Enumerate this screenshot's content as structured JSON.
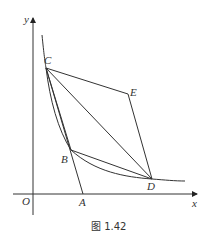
{
  "figure": {
    "caption": "图 1.42",
    "axes": {
      "x_label": "x",
      "y_label": "y",
      "origin_label": "O"
    },
    "points": [
      {
        "name": "C",
        "label": "C",
        "x": 46,
        "y": 68
      },
      {
        "name": "E",
        "label": "E",
        "x": 128,
        "y": 94
      },
      {
        "name": "B",
        "label": "B",
        "x": 71,
        "y": 150
      },
      {
        "name": "D",
        "label": "D",
        "x": 152,
        "y": 179
      },
      {
        "name": "A",
        "label": "A",
        "x": 83,
        "y": 194
      }
    ],
    "segments": [
      "C-E",
      "E-D",
      "C-D",
      "C-B",
      "B-D",
      "C-A"
    ],
    "curve": "hyperbola through C, B, D",
    "colors": {
      "stroke": "#333333",
      "background": "#ffffff"
    }
  }
}
